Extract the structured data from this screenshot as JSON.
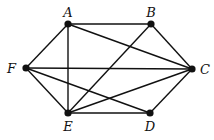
{
  "graph": {
    "nodes": [
      {
        "id": "A",
        "label": "A",
        "x": 68,
        "y": 24,
        "lx": 68,
        "ly": 17,
        "anchor": "middle"
      },
      {
        "id": "B",
        "label": "B",
        "x": 151,
        "y": 24,
        "lx": 151,
        "ly": 17,
        "anchor": "middle"
      },
      {
        "id": "C",
        "label": "C",
        "x": 192,
        "y": 69,
        "lx": 200,
        "ly": 74,
        "anchor": "start"
      },
      {
        "id": "D",
        "label": "D",
        "x": 150,
        "y": 113,
        "lx": 150,
        "ly": 131,
        "anchor": "middle"
      },
      {
        "id": "E",
        "label": "E",
        "x": 68,
        "y": 113,
        "lx": 68,
        "ly": 131,
        "anchor": "middle"
      },
      {
        "id": "F",
        "label": "F",
        "x": 26,
        "y": 68,
        "lx": 16,
        "ly": 73,
        "anchor": "end"
      }
    ],
    "edges": [
      [
        "A",
        "B"
      ],
      [
        "A",
        "C"
      ],
      [
        "A",
        "F"
      ],
      [
        "A",
        "E"
      ],
      [
        "B",
        "C"
      ],
      [
        "B",
        "E"
      ],
      [
        "C",
        "F"
      ],
      [
        "C",
        "E"
      ],
      [
        "C",
        "D"
      ],
      [
        "D",
        "E"
      ],
      [
        "D",
        "F"
      ],
      [
        "E",
        "F"
      ]
    ]
  },
  "style": {
    "color": "#111111"
  }
}
